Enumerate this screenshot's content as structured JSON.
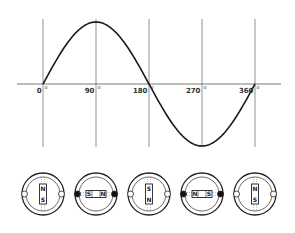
{
  "chart_data": {
    "type": "line",
    "title": "",
    "xlabel": "",
    "ylabel": "",
    "x_ticks": [
      "0",
      "90",
      "180",
      "270",
      "360"
    ],
    "degree_symbol": "o",
    "x": [
      0,
      45,
      90,
      135,
      180,
      225,
      270,
      315,
      360
    ],
    "series": [
      {
        "name": "sine",
        "values": [
          0,
          0.707,
          1,
          0.707,
          0,
          -0.707,
          -1,
          -0.707,
          0
        ]
      }
    ],
    "ylim": [
      -1,
      1
    ],
    "xlim": [
      0,
      360
    ],
    "grid": "vertical lines at each tick"
  },
  "rotors": [
    {
      "angle": 0,
      "orientation": "vertical",
      "top": "N",
      "bottom": "S",
      "brushes": "open"
    },
    {
      "angle": 90,
      "orientation": "horizontal",
      "left": "S",
      "right": "N",
      "brushes": "filled"
    },
    {
      "angle": 180,
      "orientation": "vertical",
      "top": "S",
      "bottom": "N",
      "brushes": "open"
    },
    {
      "angle": 270,
      "orientation": "horizontal",
      "left": "N",
      "right": "S",
      "brushes": "filled"
    },
    {
      "angle": 360,
      "orientation": "vertical",
      "top": "N",
      "bottom": "S",
      "brushes": "open"
    }
  ],
  "colors": {
    "line": "#1a1a1a",
    "grid": "#555555",
    "background": "#ffffff"
  }
}
